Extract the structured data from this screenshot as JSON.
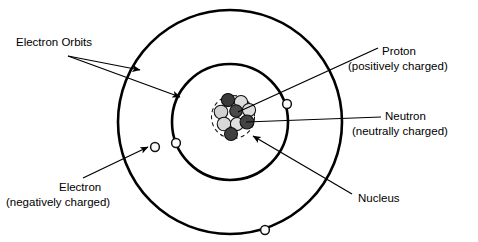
{
  "diagram": {
    "background_color": "#ffffff",
    "line_color": "#000000",
    "text_color": "#000000",
    "center": {
      "x": 230,
      "y": 122
    }
  },
  "labels": {
    "electron_orbits": {
      "line1": "Electron Orbits",
      "x": 16,
      "y": 43
    },
    "electron": {
      "line1": "Electron",
      "line2": "(negatively charged)",
      "x1": 59,
      "y1": 188,
      "x2": 6,
      "y2": 203
    },
    "proton": {
      "line1": "Proton",
      "line2": "(positively charged)",
      "x1": 382,
      "y1": 52,
      "x2": 348,
      "y2": 67
    },
    "neutron": {
      "line1": "Neutron",
      "line2": "(neutrally charged)",
      "x1": 385,
      "y1": 117,
      "x2": 352,
      "y2": 132
    },
    "nucleus": {
      "line1": "Nucleus",
      "x": 358,
      "y": 199
    }
  },
  "orbits": [
    {
      "name": "outer-orbit",
      "radius": 112,
      "stroke_width": 2.6
    },
    {
      "name": "inner-orbit",
      "radius": 58,
      "stroke_width": 2.6
    }
  ],
  "nucleus_boundary": {
    "radius": 21.5,
    "dash": "dashed",
    "color": "#1a1a1a"
  },
  "electrons": [
    {
      "name": "electron-outer-left",
      "x": 155,
      "y": 147,
      "r": 4.4,
      "orbit": "outer"
    },
    {
      "name": "electron-outer-bottom",
      "x": 265,
      "y": 230,
      "r": 4.4,
      "orbit": "outer"
    },
    {
      "name": "electron-inner-left",
      "x": 176,
      "y": 143,
      "r": 4.4,
      "orbit": "inner"
    },
    {
      "name": "electron-inner-right",
      "x": 287,
      "y": 104,
      "r": 4.4,
      "orbit": "inner"
    }
  ],
  "nucleons": [
    {
      "name": "neutron-1",
      "type": "neutron",
      "x": 228,
      "y": 100,
      "r": 6.6,
      "color": "#3a3a3a"
    },
    {
      "name": "proton-1",
      "type": "proton",
      "x": 241,
      "y": 102,
      "r": 6.6,
      "color": "#dcdcdc"
    },
    {
      "name": "proton-2",
      "type": "proton",
      "x": 221,
      "y": 112,
      "r": 6.8,
      "color": "#d2d2d2"
    },
    {
      "name": "neutron-2",
      "type": "neutron",
      "x": 236,
      "y": 111,
      "r": 6.3,
      "color": "#4a4a4a"
    },
    {
      "name": "proton-3",
      "type": "proton",
      "x": 249,
      "y": 110,
      "r": 6.6,
      "color": "#dcdcdc"
    },
    {
      "name": "neutron-3",
      "type": "neutron",
      "x": 247,
      "y": 122,
      "r": 7.0,
      "color": "#434343"
    },
    {
      "name": "proton-4",
      "type": "proton",
      "x": 224,
      "y": 124,
      "r": 6.8,
      "color": "#d8d8d8"
    },
    {
      "name": "proton-5",
      "type": "proton",
      "x": 237,
      "y": 124,
      "r": 6.6,
      "color": "#e0e0e0"
    },
    {
      "name": "neutron-4",
      "type": "neutron",
      "x": 231,
      "y": 134,
      "r": 6.5,
      "color": "#3f3f3f"
    }
  ],
  "colors": {
    "proton_fill": "#dcdcdc",
    "neutron_fill": "#3a3a3a",
    "electron_fill": "#fbfbfb",
    "outline": "#000000"
  }
}
